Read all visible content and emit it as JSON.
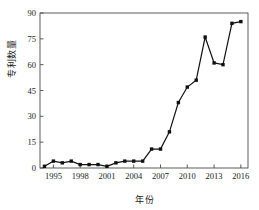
{
  "chart_data": {
    "type": "line",
    "title": "",
    "xlabel": "年份",
    "ylabel": "专利数量",
    "xlim": [
      1993.5,
      2016.8
    ],
    "ylim": [
      0,
      90
    ],
    "grid": false,
    "legend": null,
    "x_ticks": [
      "1995",
      "1998",
      "2001",
      "2004",
      "2007",
      "2010",
      "2013",
      "2016"
    ],
    "x_tick_values": [
      1995,
      1998,
      2001,
      2004,
      2007,
      2010,
      2013,
      2016
    ],
    "y_ticks": [
      "0",
      "15",
      "30",
      "45",
      "60",
      "75",
      "90"
    ],
    "y_tick_values": [
      0,
      15,
      30,
      45,
      60,
      75,
      90
    ],
    "marker": "filled-square",
    "line_color": "#111111",
    "marker_color": "#111111",
    "x": [
      1994,
      1995,
      1996,
      1997,
      1998,
      1999,
      2000,
      2001,
      2002,
      2003,
      2004,
      2005,
      2006,
      2007,
      2008,
      2009,
      2010,
      2011,
      2012,
      2013,
      2014,
      2015,
      2016
    ],
    "values": [
      1,
      4,
      3,
      4,
      2,
      2,
      2,
      1,
      3,
      4,
      4,
      11,
      11,
      21,
      38,
      47,
      51,
      76,
      61,
      60,
      84,
      85,
      85
    ],
    "series": [
      {
        "name": "专利数量",
        "points": [
          {
            "x": 1994,
            "y": 1
          },
          {
            "x": 1995,
            "y": 4
          },
          {
            "x": 1996,
            "y": 3
          },
          {
            "x": 1997,
            "y": 4
          },
          {
            "x": 1998,
            "y": 2
          },
          {
            "x": 1999,
            "y": 2
          },
          {
            "x": 2000,
            "y": 2
          },
          {
            "x": 2001,
            "y": 1
          },
          {
            "x": 2002,
            "y": 3
          },
          {
            "x": 2003,
            "y": 4
          },
          {
            "x": 2004,
            "y": 4
          },
          {
            "x": 2005,
            "y": 4
          },
          {
            "x": 2006,
            "y": 11
          },
          {
            "x": 2007,
            "y": 11
          },
          {
            "x": 2008,
            "y": 21
          },
          {
            "x": 2009,
            "y": 38
          },
          {
            "x": 2010,
            "y": 47
          },
          {
            "x": 2011,
            "y": 51
          },
          {
            "x": 2012,
            "y": 76
          },
          {
            "x": 2013,
            "y": 61
          },
          {
            "x": 2014,
            "y": 60
          },
          {
            "x": 2015,
            "y": 84
          },
          {
            "x": 2016,
            "y": 85
          }
        ]
      }
    ]
  }
}
